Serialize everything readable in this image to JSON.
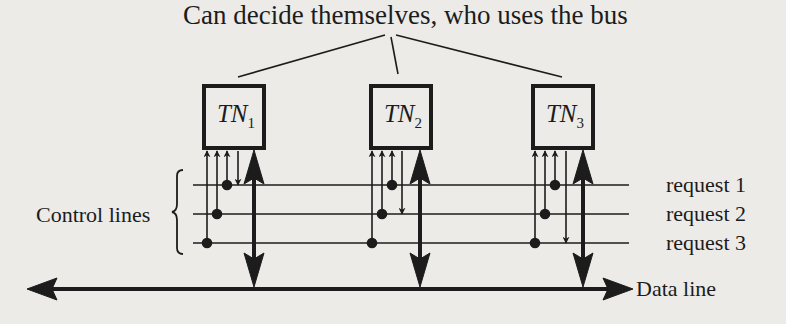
{
  "title": "Can decide themselves, who uses the bus",
  "control_lines_label": "Control lines",
  "data_line_label": "Data line",
  "requests": [
    {
      "label": "request 1"
    },
    {
      "label": "request 2"
    },
    {
      "label": "request 3"
    }
  ],
  "nodes": [
    {
      "name": "TN",
      "sub": "1"
    },
    {
      "name": "TN",
      "sub": "2"
    },
    {
      "name": "TN",
      "sub": "3"
    }
  ],
  "colors": {
    "background": "#ecebe8",
    "ink": "#1c1c1c"
  }
}
